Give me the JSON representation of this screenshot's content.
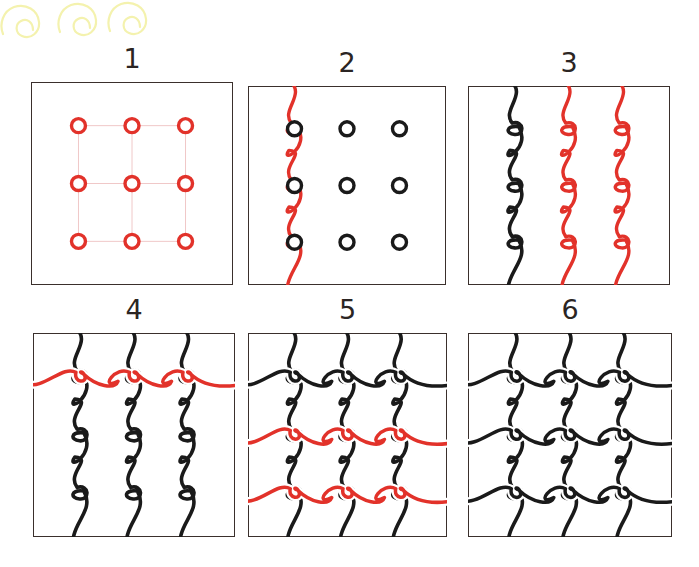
{
  "document": {
    "title": "Celtic knot step-by-step drawing tutorial",
    "background_color": "#ffffff",
    "width": 699,
    "height": 567
  },
  "decoration": {
    "name": "yellow-spiral-doodles",
    "color": "#f2f0a8",
    "count": 3
  },
  "palette": {
    "ink": "#1a1a1a",
    "accent_red": "#e2322a",
    "grid_pink": "#f0c8c8",
    "dot_red": "#e2322a",
    "frame": "#3a2f2c",
    "doodle_yellow": "#f4f2ae",
    "paper": "#ffffff"
  },
  "panels": [
    {
      "number": "1",
      "label": "Step 1 — dot grid",
      "x": 31,
      "y": 82,
      "w": 202,
      "h": 203,
      "grid": {
        "rows": 3,
        "cols": 3,
        "dot_color": "#e2322a",
        "line_color": "#f0c8c8",
        "dot_radius": 7
      },
      "verticals": [],
      "horizontals": [],
      "dots_visible": true
    },
    {
      "number": "2",
      "label": "Step 2 — first vertical wavy strand (red)",
      "x": 248,
      "y": 86,
      "w": 198,
      "h": 199,
      "grid": {
        "rows": 3,
        "cols": 3,
        "dot_color": "#1a1a1a",
        "line_color": "none",
        "dot_radius": 7
      },
      "verticals": [
        {
          "col": 0,
          "color": "#e2322a"
        }
      ],
      "horizontals": [],
      "dots_visible": true
    },
    {
      "number": "3",
      "label": "Step 3 — remaining two verticals (red)",
      "x": 468,
      "y": 86,
      "w": 202,
      "h": 199,
      "grid": {
        "rows": 3,
        "cols": 3,
        "dot_color": "#1a1a1a",
        "line_color": "none",
        "dot_radius": 0
      },
      "verticals": [
        {
          "col": 0,
          "color": "#1a1a1a"
        },
        {
          "col": 1,
          "color": "#e2322a"
        },
        {
          "col": 2,
          "color": "#e2322a"
        }
      ],
      "horizontals": [],
      "dots_visible": false
    },
    {
      "number": "4",
      "label": "Step 4 — first horizontal wavy strand (red)",
      "x": 33,
      "y": 333,
      "w": 202,
      "h": 204,
      "grid": {
        "rows": 3,
        "cols": 3,
        "dot_color": "#1a1a1a",
        "line_color": "none",
        "dot_radius": 0
      },
      "verticals": [
        {
          "col": 0,
          "color": "#1a1a1a"
        },
        {
          "col": 1,
          "color": "#1a1a1a"
        },
        {
          "col": 2,
          "color": "#1a1a1a"
        }
      ],
      "horizontals": [
        {
          "row": 0,
          "color": "#e2322a"
        }
      ],
      "dots_visible": false
    },
    {
      "number": "5",
      "label": "Step 5 — remaining two horizontals (red)",
      "x": 248,
      "y": 333,
      "w": 199,
      "h": 204,
      "grid": {
        "rows": 3,
        "cols": 3,
        "dot_color": "#1a1a1a",
        "line_color": "none",
        "dot_radius": 0
      },
      "verticals": [
        {
          "col": 0,
          "color": "#1a1a1a"
        },
        {
          "col": 1,
          "color": "#1a1a1a"
        },
        {
          "col": 2,
          "color": "#1a1a1a"
        }
      ],
      "horizontals": [
        {
          "row": 0,
          "color": "#1a1a1a"
        },
        {
          "row": 1,
          "color": "#e2322a"
        },
        {
          "row": 2,
          "color": "#e2322a"
        }
      ],
      "dots_visible": false
    },
    {
      "number": "6",
      "label": "Step 6 — finished knot, all strands inked",
      "x": 468,
      "y": 333,
      "w": 204,
      "h": 204,
      "grid": {
        "rows": 3,
        "cols": 3,
        "dot_color": "#1a1a1a",
        "line_color": "none",
        "dot_radius": 0
      },
      "verticals": [
        {
          "col": 0,
          "color": "#1a1a1a"
        },
        {
          "col": 1,
          "color": "#1a1a1a"
        },
        {
          "col": 2,
          "color": "#1a1a1a"
        }
      ],
      "horizontals": [
        {
          "row": 0,
          "color": "#1a1a1a"
        },
        {
          "row": 1,
          "color": "#1a1a1a"
        },
        {
          "row": 2,
          "color": "#1a1a1a"
        }
      ],
      "dots_visible": false
    }
  ]
}
